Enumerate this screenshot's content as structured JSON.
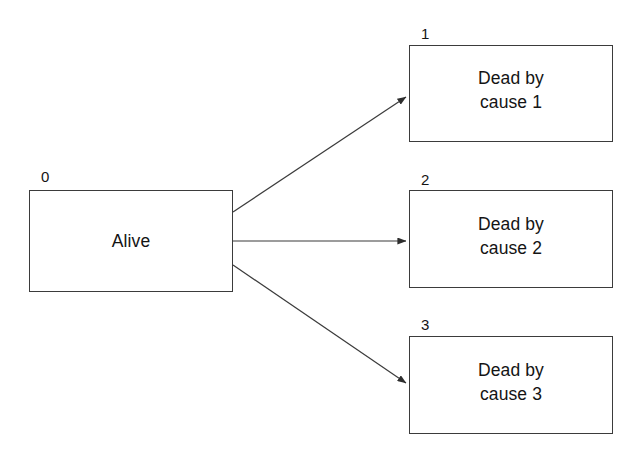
{
  "diagram": {
    "background_color": "#ffffff",
    "stroke_color": "#3b3b3b",
    "text_color": "#141414",
    "nodes": [
      {
        "id": "0",
        "label": "Alive"
      },
      {
        "id": "1",
        "label": "Dead by\ncause 1"
      },
      {
        "id": "2",
        "label": "Dead by\ncause 2"
      },
      {
        "id": "3",
        "label": "Dead by\ncause 3"
      }
    ],
    "edges": [
      {
        "from": "0",
        "to": "1",
        "style": "arrow"
      },
      {
        "from": "0",
        "to": "2",
        "style": "arrow"
      },
      {
        "from": "0",
        "to": "3",
        "style": "arrow"
      }
    ]
  }
}
